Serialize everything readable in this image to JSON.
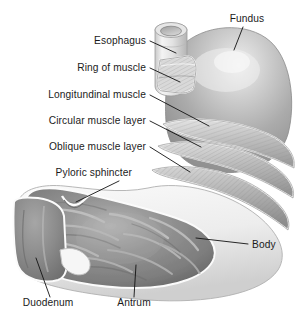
{
  "figure": {
    "background_color": "#ffffff",
    "label_color": "#1b1b1b",
    "leader_color": "#121212"
  },
  "palette": {
    "outer_wall_light": "#f2f2f2",
    "outer_wall_shadow": "#bdbdbd",
    "fundus_gray": "#a8a8a8",
    "fundus_highlight": "#e8e8e8",
    "muscle_band_light": "#d8d8d8",
    "muscle_band_dark": "#9a9a9a",
    "mucosa_gray": "#8e8e8e",
    "mucosa_highlight": "#c9c9c9",
    "mucosa_shadow": "#6e6e6e",
    "rim_white": "#fbfbfb"
  },
  "labels": [
    {
      "id": "esophagus",
      "text": "Esophagus",
      "align": "right",
      "x": 146,
      "y": 44,
      "leader": "M150,41 L176,53"
    },
    {
      "id": "ring-of-muscle",
      "text": "Ring of muscle",
      "align": "right",
      "x": 146,
      "y": 71,
      "leader": "M150,68 L180,82"
    },
    {
      "id": "longitudinal-muscle",
      "text": "Longitundinal muscle",
      "align": "right",
      "x": 146,
      "y": 98,
      "leader": "M150,95 L209,126"
    },
    {
      "id": "circular-muscle",
      "text": "Circular muscle layer",
      "align": "right",
      "x": 146,
      "y": 124,
      "leader": "M150,121 L201,147"
    },
    {
      "id": "oblique-muscle",
      "text": "Oblique muscle layer",
      "align": "right",
      "x": 146,
      "y": 150,
      "leader": "M150,147 L190,172"
    },
    {
      "id": "pyloric-sphincter",
      "text": "Pyloric sphincter",
      "align": "right",
      "x": 132,
      "y": 176,
      "leader": "M119,181 L76,202"
    },
    {
      "id": "fundus",
      "text": "Fundus",
      "align": "mid",
      "x": 247,
      "y": 22,
      "leader": "M243,27 L234,50"
    },
    {
      "id": "body",
      "text": "Body",
      "align": "left",
      "x": 252,
      "y": 248,
      "leader": "M248,244 L196,238"
    },
    {
      "id": "duodenum",
      "text": "Duodenum",
      "align": "mid",
      "x": 48,
      "y": 306,
      "leader": "M50,297 L36,258"
    },
    {
      "id": "antrum",
      "text": "Antrum",
      "align": "mid",
      "x": 134,
      "y": 306,
      "leader": "M134,297 L136,265"
    }
  ],
  "structures": [
    {
      "id": "esophagus-tube",
      "name": "Esophagus tube"
    },
    {
      "id": "esophagus-lumen",
      "name": "Esophagus lumen opening"
    },
    {
      "id": "muscle-ring-window",
      "name": "Cutaway window showing ring of muscle"
    },
    {
      "id": "fundus-dome",
      "name": "Fundus dome"
    },
    {
      "id": "longitudinal-band",
      "name": "Longitudinal muscle band"
    },
    {
      "id": "circular-band",
      "name": "Circular muscle layer band"
    },
    {
      "id": "oblique-band",
      "name": "Oblique muscle layer band"
    },
    {
      "id": "stomach-outer-wall",
      "name": "Stomach outer wall"
    },
    {
      "id": "mucosa-rugae",
      "name": "Gastric mucosa with rugae"
    },
    {
      "id": "pyloric-notch",
      "name": "Pyloric sphincter notch"
    },
    {
      "id": "duodenum-segment",
      "name": "Duodenum segment"
    }
  ]
}
